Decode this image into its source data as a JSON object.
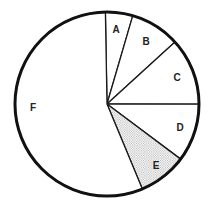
{
  "chart_data": {
    "type": "pie",
    "title": "",
    "start_angle_deg": -1,
    "direction": "clockwise",
    "categories": [
      "A",
      "B",
      "C",
      "D",
      "E",
      "F"
    ],
    "values": [
      4.8,
      8.7,
      11.8,
      10.2,
      8.5,
      56.0
    ],
    "unit": "percent (estimated from slice angles)",
    "highlighted": [
      "E"
    ],
    "legend": "none (labels inside slices)",
    "slices": [
      {
        "label": "A",
        "value": 4.8,
        "fill": "white"
      },
      {
        "label": "B",
        "value": 8.7,
        "fill": "white"
      },
      {
        "label": "C",
        "value": 11.8,
        "fill": "white"
      },
      {
        "label": "D",
        "value": 10.2,
        "fill": "white"
      },
      {
        "label": "E",
        "value": 8.5,
        "fill": "stipple"
      },
      {
        "label": "F",
        "value": 56.0,
        "fill": "white"
      }
    ],
    "label_positions": {
      "A": [
        116,
        29
      ],
      "B": [
        146,
        41
      ],
      "C": [
        177,
        77
      ],
      "D": [
        180,
        127
      ],
      "E": [
        156,
        165
      ],
      "F": [
        33,
        107
      ]
    }
  },
  "geometry": {
    "cx": 107,
    "cy": 104,
    "r": 92
  },
  "colors": {
    "stroke": "#111111",
    "fill": "#ffffff",
    "dots": "#8a8a8a"
  }
}
